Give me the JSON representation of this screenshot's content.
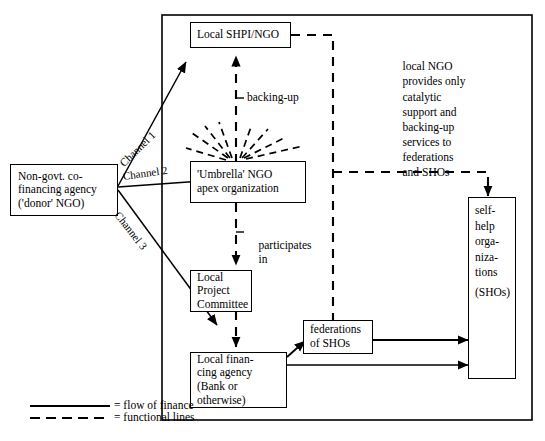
{
  "diagram": {
    "boxes": {
      "donor": {
        "name": "non-govt-co-financing-agency",
        "lines": [
          "Non-govt. co-",
          "financing agency",
          "('donor' NGO)"
        ]
      },
      "local_shpi": {
        "name": "local-shpi-ngo",
        "lines": [
          "Local SHPI/NGO"
        ]
      },
      "umbrella": {
        "name": "umbrella-ngo-apex-organization",
        "lines": [
          "'Umbrella' NGO",
          "apex organization"
        ]
      },
      "project_committee": {
        "name": "local-project-committee",
        "lines": [
          "Local",
          "Project",
          "Committee"
        ]
      },
      "financing_agency": {
        "name": "local-financing-agency",
        "lines": [
          "Local finan-",
          "cing agency",
          "(Bank or",
          "otherwise)"
        ]
      },
      "federations": {
        "name": "federations-of-shos",
        "lines": [
          "federations",
          "of SHOs"
        ]
      },
      "shos": {
        "name": "self-help-organizations",
        "lines": [
          "self-",
          "help",
          "orga-",
          "niza-",
          "tions",
          "",
          "(SHOs)"
        ]
      }
    },
    "channels": [
      {
        "label": "Channel 1"
      },
      {
        "label": "Channel 2"
      },
      {
        "label": "Channel 3"
      }
    ],
    "edge_labels": {
      "backing_up": "backing-up",
      "participates_in": [
        "participates",
        "in"
      ]
    },
    "annotation": {
      "name": "local-ngo-note",
      "lines": [
        "local NGO",
        "provides only",
        "catalytic",
        "support and",
        "backing-up",
        "services to",
        "federations",
        "and SHOs"
      ]
    },
    "legend": {
      "solid_label": "= flow of finance",
      "dashed_label": "= functional lines"
    },
    "colors": {
      "line": "#000000",
      "background": "#ffffff"
    }
  }
}
